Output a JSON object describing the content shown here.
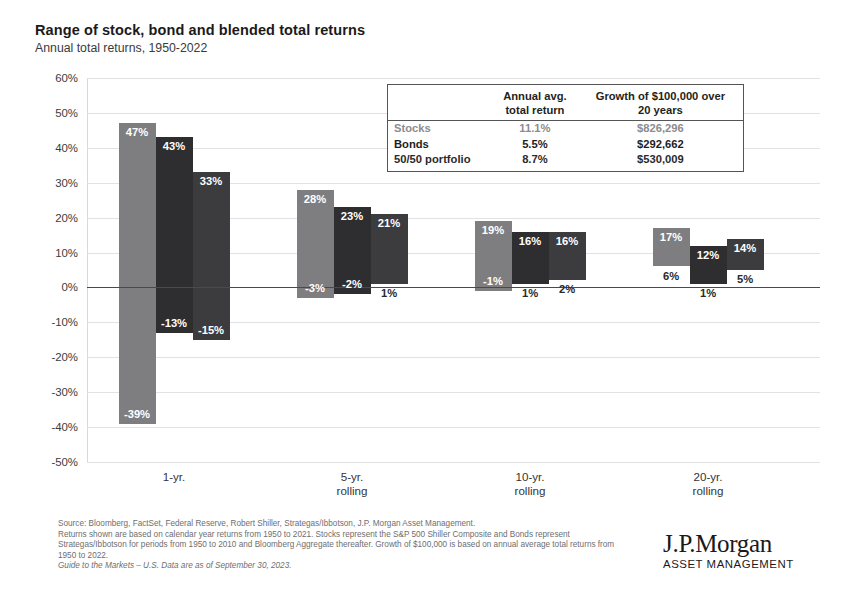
{
  "header": {
    "title": "Range of stock, bond and blended total returns",
    "subtitle": "Annual total returns, 1950-2022"
  },
  "summary_table": {
    "col_headers": [
      "",
      "Annual avg.\ntotal return",
      "Growth of $100,000 over\n20 years"
    ],
    "col_header_1_line1": "Annual avg.",
    "col_header_1_line2": "total return",
    "col_header_2_line1": "Growth of $100,000 over",
    "col_header_2_line2": "20 years",
    "rows": [
      {
        "name": "Stocks",
        "avg_return": "11.1%",
        "growth": "$826,296"
      },
      {
        "name": "Bonds",
        "avg_return": "5.5%",
        "growth": "$292,662"
      },
      {
        "name": "50/50 portfolio",
        "avg_return": "8.7%",
        "growth": "$530,009"
      }
    ]
  },
  "footnote": {
    "line1": "Source: Bloomberg, FactSet, Federal Reserve, Robert Shiller, Strategas/Ibbotson, J.P. Morgan Asset Management.",
    "line2": "Returns shown are based on calendar year returns from 1950 to 2021. Stocks represent the S&P 500 Shiller Composite and Bonds represent Strategas/Ibbotson for periods from 1950 to 2010 and Bloomberg Aggregate thereafter. Growth of $100,000 is based on annual average total returns from 1950 to 2022.",
    "line3": "Guide to the Markets – U.S. Data are as of September 30, 2023."
  },
  "logo": {
    "wordmark": "J.P.Morgan",
    "tagline": "ASSET MANAGEMENT"
  },
  "colors": {
    "stocks": "#7e7e80",
    "bonds": "#2e2e30",
    "blend": "#3c3c3e",
    "zero_line": "#4a4a4a",
    "gridline": "#e2e2e4"
  },
  "chart_data": {
    "type": "bar",
    "subtype": "floating-range-bar",
    "title": "Range of stock, bond and blended total returns",
    "subtitle": "Annual total returns, 1950-2022",
    "xlabel": "",
    "ylabel": "",
    "ylim": [
      -50,
      60
    ],
    "ytick_values": [
      60,
      50,
      40,
      30,
      20,
      10,
      0,
      -10,
      -20,
      -30,
      -40,
      -50
    ],
    "ytick_labels": [
      "60%",
      "50%",
      "40%",
      "30%",
      "20%",
      "10%",
      "0%",
      "-10%",
      "-20%",
      "-30%",
      "-40%",
      "-50%"
    ],
    "grid": true,
    "legend_position": "table-inset-top-right",
    "categories": [
      "1-yr.",
      "5-yr.\nrolling",
      "10-yr.\nrolling",
      "20-yr.\nrolling"
    ],
    "category_labels": [
      {
        "line1": "1-yr.",
        "line2": ""
      },
      {
        "line1": "5-yr.",
        "line2": "rolling"
      },
      {
        "line1": "10-yr.",
        "line2": "rolling"
      },
      {
        "line1": "20-yr.",
        "line2": "rolling"
      }
    ],
    "series": [
      {
        "name": "Stocks",
        "color": "#7e7e80",
        "max_values": [
          47,
          28,
          19,
          17
        ],
        "min_values": [
          -39,
          -3,
          -1,
          6
        ],
        "max_labels": [
          "47%",
          "28%",
          "19%",
          "17%"
        ],
        "min_labels": [
          "-39%",
          "-3%",
          "-1%",
          "6%"
        ]
      },
      {
        "name": "Bonds",
        "color": "#2e2e30",
        "max_values": [
          43,
          23,
          16,
          12
        ],
        "min_values": [
          -13,
          -2,
          1,
          1
        ],
        "max_labels": [
          "43%",
          "23%",
          "16%",
          "12%"
        ],
        "min_labels": [
          "-13%",
          "-2%",
          "1%",
          "1%"
        ]
      },
      {
        "name": "50/50 portfolio",
        "color": "#3c3c3e",
        "max_values": [
          33,
          21,
          16,
          14
        ],
        "min_values": [
          -15,
          1,
          2,
          5
        ],
        "max_labels": [
          "33%",
          "21%",
          "16%",
          "14%"
        ],
        "min_labels": [
          "-15%",
          "1%",
          "2%",
          "5%"
        ]
      }
    ],
    "annotations": {
      "summary_avg_returns": {
        "Stocks": "11.1%",
        "Bonds": "5.5%",
        "50/50 portfolio": "8.7%"
      },
      "summary_growth_100k_20yr": {
        "Stocks": "$826,296",
        "Bonds": "$292,662",
        "50/50 portfolio": "$530,009"
      }
    }
  }
}
